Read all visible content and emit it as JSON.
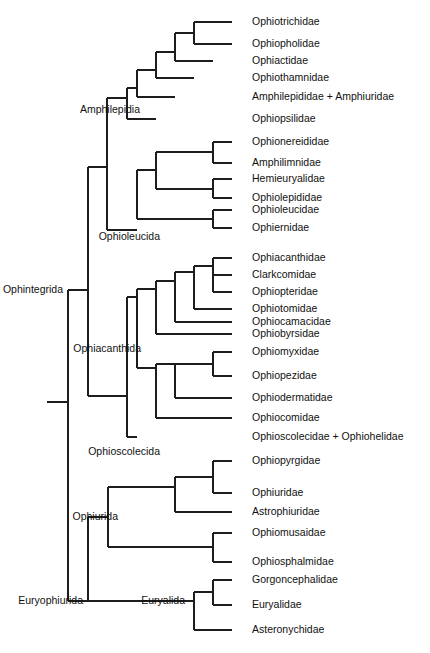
{
  "figure": {
    "name": "ophiuroidea-phylogenetic-tree",
    "type": "cladogram",
    "width": 430,
    "height": 653,
    "background_color": "#ffffff",
    "line_color": "#1d1d1d",
    "text_color": "#111111"
  },
  "tips": [
    {
      "id": "ophiotrichidae",
      "label": "Ophiotrichidae",
      "x": 232,
      "y": 22,
      "label_x": 252
    },
    {
      "id": "ophiopholidae",
      "label": "Ophiopholidae",
      "x": 232,
      "y": 44,
      "label_x": 252
    },
    {
      "id": "ophiactidae",
      "label": "Ophiactidae",
      "x": 213,
      "y": 61,
      "label_x": 252
    },
    {
      "id": "ophiothamnidae",
      "label": "Ophiothamnidae",
      "x": 194,
      "y": 78,
      "label_x": 252
    },
    {
      "id": "amphilepididae",
      "label": "Amphilepididae + Amphiuridae",
      "x": 175,
      "y": 97,
      "label_x": 252
    },
    {
      "id": "ophiopsilidae",
      "label": "Ophiopsilidae",
      "x": 156,
      "y": 119,
      "label_x": 252
    },
    {
      "id": "ophionereididae",
      "label": "Ophionereididae",
      "x": 232,
      "y": 142,
      "label_x": 252
    },
    {
      "id": "amphilimnidae",
      "label": "Amphilimnidae",
      "x": 232,
      "y": 163,
      "label_x": 252
    },
    {
      "id": "hemieuryalidae",
      "label": "Hemieuryalidae",
      "x": 232,
      "y": 179,
      "label_x": 252
    },
    {
      "id": "ophiolepididae",
      "label": "Ophiolepididae",
      "x": 232,
      "y": 198,
      "label_x": 252
    },
    {
      "id": "ophioleucidae",
      "label": "Ophioleucidae",
      "x": 232,
      "y": 210,
      "label_x": 252
    },
    {
      "id": "ophiernidae",
      "label": "Ophiernidae",
      "x": 232,
      "y": 228,
      "label_x": 252
    },
    {
      "id": "ophiacanthidae",
      "label": "Ophiacanthidae",
      "x": 232,
      "y": 258,
      "label_x": 252
    },
    {
      "id": "clarkcomidae",
      "label": "Clarkcomidae",
      "x": 232,
      "y": 275,
      "label_x": 252
    },
    {
      "id": "ophiopteridae",
      "label": "Ophiopteridae",
      "x": 213,
      "y": 292,
      "label_x": 252
    },
    {
      "id": "ophiotomidae",
      "label": "Ophiotomidae",
      "x": 194,
      "y": 309,
      "label_x": 252
    },
    {
      "id": "ophiocamacidae",
      "label": "Ophiocamacidae",
      "x": 175,
      "y": 322,
      "label_x": 252
    },
    {
      "id": "ophiobyrsidae",
      "label": "Ophiobyrsidae",
      "x": 156,
      "y": 334,
      "label_x": 252
    },
    {
      "id": "ophiomyxidae",
      "label": "Ophiomyxidae",
      "x": 232,
      "y": 352,
      "label_x": 252
    },
    {
      "id": "ophiopezidae",
      "label": "Ophiopezidae",
      "x": 232,
      "y": 376,
      "label_x": 252
    },
    {
      "id": "ophiodermatidae",
      "label": "Ophiodermatidae",
      "x": 194,
      "y": 398,
      "label_x": 252
    },
    {
      "id": "ophiocomidae",
      "label": "Ophiocomidae",
      "x": 175,
      "y": 418,
      "label_x": 252
    },
    {
      "id": "ophioscolecidae",
      "label": "Ophioscolecidae + Ophiohelidae",
      "x": 137,
      "y": 437,
      "label_x": 252
    },
    {
      "id": "ophiopyrgidae",
      "label": "Ophiopyrgidae",
      "x": 232,
      "y": 461,
      "label_x": 252
    },
    {
      "id": "ophiuridae",
      "label": "Ophiuridae",
      "x": 232,
      "y": 493,
      "label_x": 252
    },
    {
      "id": "astrophiuridae",
      "label": "Astrophiuridae",
      "x": 194,
      "y": 512,
      "label_x": 252
    },
    {
      "id": "ophiomusaidae",
      "label": "Ophiomusaidae",
      "x": 232,
      "y": 533,
      "label_x": 252
    },
    {
      "id": "ophiosphalmidae",
      "label": "Ophiosphalmidae",
      "x": 232,
      "y": 562,
      "label_x": 252
    },
    {
      "id": "gorgoncephalidae",
      "label": "Gorgoncephalidae",
      "x": 232,
      "y": 580,
      "label_x": 252
    },
    {
      "id": "euryalidae",
      "label": "Euryalidae",
      "x": 232,
      "y": 605,
      "label_x": 252
    },
    {
      "id": "asteronychidae",
      "label": "Asteronychidae",
      "x": 194,
      "y": 630,
      "label_x": 252
    }
  ],
  "clade_labels": [
    {
      "id": "ophintegrida",
      "label": "Ophintegrida",
      "x": 63,
      "y": 290,
      "anchor": "end"
    },
    {
      "id": "euryophiurida",
      "label": "Euryophiurida",
      "x": 83,
      "y": 601,
      "anchor": "end"
    },
    {
      "id": "amphilepidia",
      "label": "Amphilepidia",
      "x": 140,
      "y": 110,
      "anchor": "end"
    },
    {
      "id": "ophioleucida",
      "label": "Ophioleucida",
      "x": 160,
      "y": 237,
      "anchor": "end"
    },
    {
      "id": "ophiacanthida",
      "label": "Ophiacanthida",
      "x": 141,
      "y": 349,
      "anchor": "end"
    },
    {
      "id": "ophioscolecida",
      "label": "Ophioscolecida",
      "x": 160,
      "y": 452,
      "anchor": "end"
    },
    {
      "id": "ophiurida",
      "label": "Ophiurida",
      "x": 118,
      "y": 517,
      "anchor": "end"
    },
    {
      "id": "euryalida",
      "label": "Euryalida",
      "x": 185,
      "y": 601,
      "anchor": "end"
    }
  ],
  "segments": [
    {
      "id": "root-stub",
      "type": "h",
      "x1": 47,
      "x2": 68,
      "y": 402
    },
    {
      "id": "root-vertical",
      "type": "v",
      "x": 68,
      "y1": 290,
      "y2": 601
    },
    {
      "id": "ophintegrida-connector",
      "type": "h",
      "x1": 68,
      "x2": 88,
      "y": 290
    },
    {
      "id": "euryophiurida-connector",
      "type": "h",
      "x1": 68,
      "x2": 88,
      "y": 601
    },
    {
      "id": "ophintegrida-vertical",
      "type": "v",
      "x": 88,
      "y1": 167,
      "y2": 396
    },
    {
      "id": "amphi-ophioleuc-stem",
      "type": "h",
      "x1": 88,
      "x2": 107,
      "y": 167
    },
    {
      "id": "ophiacanthida-stem",
      "type": "h",
      "x1": 88,
      "x2": 127,
      "y": 396
    },
    {
      "id": "amphilepidia-vertical",
      "type": "v",
      "x": 107,
      "y1": 98,
      "y2": 230
    },
    {
      "id": "amphilepidia-stem",
      "type": "h",
      "x1": 107,
      "x2": 127,
      "y": 98
    },
    {
      "id": "ophioleucida-stem",
      "type": "h",
      "x1": 107,
      "x2": 137,
      "y": 230
    },
    {
      "id": "amph-inner-vertical",
      "type": "v",
      "x": 127,
      "y1": 88,
      "y2": 119
    },
    {
      "id": "amph-inner-stem",
      "type": "h",
      "x1": 127,
      "x2": 137,
      "y": 88
    },
    {
      "id": "ophiopsilidae-branch",
      "type": "h",
      "x1": 127,
      "x2": 156,
      "y": 119
    },
    {
      "id": "amph-n2-vertical",
      "type": "v",
      "x": 137,
      "y1": 70,
      "y2": 97
    },
    {
      "id": "amph-n2-stem",
      "type": "h",
      "x1": 137,
      "x2": 156,
      "y": 70
    },
    {
      "id": "amphilepididae-branch",
      "type": "h",
      "x1": 137,
      "x2": 175,
      "y": 97
    },
    {
      "id": "amph-n3-vertical",
      "type": "v",
      "x": 156,
      "y1": 52,
      "y2": 78
    },
    {
      "id": "amph-n3-stem",
      "type": "h",
      "x1": 156,
      "x2": 175,
      "y": 52
    },
    {
      "id": "ophiothamnidae-branch",
      "type": "h",
      "x1": 156,
      "x2": 194,
      "y": 78
    },
    {
      "id": "amph-n4-vertical",
      "type": "v",
      "x": 175,
      "y1": 33,
      "y2": 61
    },
    {
      "id": "amph-n4-stem",
      "type": "h",
      "x1": 175,
      "x2": 194,
      "y": 33
    },
    {
      "id": "ophiactidae-branch",
      "type": "h",
      "x1": 175,
      "x2": 213,
      "y": 61
    },
    {
      "id": "amph-n5-vertical",
      "type": "v",
      "x": 194,
      "y1": 22,
      "y2": 44
    },
    {
      "id": "ophiotrichidae-branch",
      "type": "h",
      "x1": 194,
      "x2": 232,
      "y": 22
    },
    {
      "id": "ophiopholidae-branch",
      "type": "h",
      "x1": 194,
      "x2": 232,
      "y": 44
    },
    {
      "id": "ophioleuc-vertical",
      "type": "v",
      "x": 137,
      "y1": 170,
      "y2": 219
    },
    {
      "id": "ophioleuc-upper-stem",
      "type": "h",
      "x1": 137,
      "x2": 156,
      "y": 170
    },
    {
      "id": "ophioleuc-lower-stem",
      "type": "h",
      "x1": 137,
      "x2": 213,
      "y": 219
    },
    {
      "id": "ophioleuc-n2-vertical",
      "type": "v",
      "x": 156,
      "y1": 152,
      "y2": 189
    },
    {
      "id": "ophioleuc-n2-upper",
      "type": "h",
      "x1": 156,
      "x2": 213,
      "y": 152
    },
    {
      "id": "ophioleuc-n2-lower",
      "type": "h",
      "x1": 156,
      "x2": 213,
      "y": 189
    },
    {
      "id": "ophionereid-vertical",
      "type": "v",
      "x": 213,
      "y1": 142,
      "y2": 163
    },
    {
      "id": "ophionereididae-branch",
      "type": "h",
      "x1": 213,
      "x2": 232,
      "y": 142
    },
    {
      "id": "amphilimnidae-branch",
      "type": "h",
      "x1": 213,
      "x2": 232,
      "y": 163
    },
    {
      "id": "hemieuryal-vertical",
      "type": "v",
      "x": 213,
      "y1": 179,
      "y2": 198
    },
    {
      "id": "hemieuryalidae-branch",
      "type": "h",
      "x1": 213,
      "x2": 232,
      "y": 179
    },
    {
      "id": "ophiolepididae-branch",
      "type": "h",
      "x1": 213,
      "x2": 232,
      "y": 198
    },
    {
      "id": "ophioleucidae-vertical",
      "type": "v",
      "x": 213,
      "y1": 210,
      "y2": 228
    },
    {
      "id": "ophioleucidae-branch",
      "type": "h",
      "x1": 213,
      "x2": 232,
      "y": 210
    },
    {
      "id": "ophiernidae-branch",
      "type": "h",
      "x1": 213,
      "x2": 232,
      "y": 228
    },
    {
      "id": "ophiacanthida-vertical",
      "type": "v",
      "x": 127,
      "y1": 297,
      "y2": 437
    },
    {
      "id": "ophiacanthida-upper",
      "type": "h",
      "x1": 127,
      "x2": 137,
      "y": 297
    },
    {
      "id": "ophioscolecidae-branch",
      "type": "h",
      "x1": 127,
      "x2": 137,
      "y": 437
    },
    {
      "id": "ophiac-n1-vertical",
      "type": "v",
      "x": 137,
      "y1": 289,
      "y2": 368
    },
    {
      "id": "ophiac-n1-upper",
      "type": "h",
      "x1": 137,
      "x2": 156,
      "y": 289
    },
    {
      "id": "ophiac-n1-lower",
      "type": "h",
      "x1": 137,
      "x2": 156,
      "y": 368
    },
    {
      "id": "ophiac-n2-vertical",
      "type": "v",
      "x": 156,
      "y1": 281,
      "y2": 334
    },
    {
      "id": "ophiac-n2-stem",
      "type": "h",
      "x1": 156,
      "x2": 175,
      "y": 281
    },
    {
      "id": "ophiobyrsidae-branch",
      "type": "h",
      "x1": 156,
      "x2": 232,
      "y": 334
    },
    {
      "id": "ophiac-n3-vertical",
      "type": "v",
      "x": 175,
      "y1": 272,
      "y2": 322
    },
    {
      "id": "ophiac-n3-stem",
      "type": "h",
      "x1": 175,
      "x2": 194,
      "y": 272
    },
    {
      "id": "ophiocamacidae-branch",
      "type": "h",
      "x1": 175,
      "x2": 232,
      "y": 322
    },
    {
      "id": "ophiac-n4-vertical",
      "type": "v",
      "x": 194,
      "y1": 266,
      "y2": 309
    },
    {
      "id": "ophiac-n4-stem",
      "type": "h",
      "x1": 194,
      "x2": 213,
      "y": 266
    },
    {
      "id": "ophiotomidae-branch",
      "type": "h",
      "x1": 194,
      "x2": 232,
      "y": 309
    },
    {
      "id": "ophiac-n5-vertical",
      "type": "v",
      "x": 213,
      "y1": 266,
      "y2": 292
    },
    {
      "id": "ophiopteridae-branch",
      "type": "h",
      "x1": 213,
      "x2": 232,
      "y": 292
    },
    {
      "id": "ophiac-n6-vertical",
      "type": "v",
      "x": 213,
      "y1": 258,
      "y2": 275
    },
    {
      "id": "ophiacanthidae-branch",
      "type": "h",
      "x1": 213,
      "x2": 232,
      "y": 258
    },
    {
      "id": "clarkcomidae-branch",
      "type": "h",
      "x1": 213,
      "x2": 232,
      "y": 275
    },
    {
      "id": "ophiosco-n1-vertical",
      "type": "v",
      "x": 156,
      "y1": 364,
      "y2": 418
    },
    {
      "id": "ophiosco-n1-upper",
      "type": "h",
      "x1": 156,
      "x2": 175,
      "y": 364
    },
    {
      "id": "ophiocomidae-branch",
      "type": "h",
      "x1": 156,
      "x2": 232,
      "y": 418
    },
    {
      "id": "ophiosco-n2-vertical",
      "type": "v",
      "x": 175,
      "y1": 364,
      "y2": 398
    },
    {
      "id": "ophiosco-n2-stem",
      "type": "h",
      "x1": 175,
      "x2": 194,
      "y": 364
    },
    {
      "id": "ophiodermatidae-branch",
      "type": "h",
      "x1": 175,
      "x2": 232,
      "y": 398
    },
    {
      "id": "ophiomyx-vertical",
      "type": "v",
      "x": 213,
      "y1": 352,
      "y2": 376
    },
    {
      "id": "ophiomyx-stem",
      "type": "h",
      "x1": 194,
      "x2": 213,
      "y": 364
    },
    {
      "id": "ophiomyxidae-branch",
      "type": "h",
      "x1": 213,
      "x2": 232,
      "y": 352
    },
    {
      "id": "ophiopezidae-branch",
      "type": "h",
      "x1": 213,
      "x2": 232,
      "y": 376
    },
    {
      "id": "euryophiurida-vertical",
      "type": "v",
      "x": 88,
      "y1": 517,
      "y2": 601
    },
    {
      "id": "ophiurida-stem",
      "type": "h",
      "x1": 88,
      "x2": 108,
      "y": 517
    },
    {
      "id": "euryalida-stem",
      "type": "h",
      "x1": 88,
      "x2": 194,
      "y": 601
    },
    {
      "id": "ophiurida-vertical",
      "type": "v",
      "x": 108,
      "y1": 487,
      "y2": 547
    },
    {
      "id": "ophiurida-upper-stem",
      "type": "h",
      "x1": 108,
      "x2": 175,
      "y": 487
    },
    {
      "id": "ophiurida-lower-stem",
      "type": "h",
      "x1": 108,
      "x2": 213,
      "y": 547
    },
    {
      "id": "ophiopyrg-vertical",
      "type": "v",
      "x": 175,
      "y1": 477,
      "y2": 512
    },
    {
      "id": "ophiopyrg-stem",
      "type": "h",
      "x1": 175,
      "x2": 213,
      "y": 477
    },
    {
      "id": "astrophiuridae-branch",
      "type": "h",
      "x1": 175,
      "x2": 232,
      "y": 512
    },
    {
      "id": "ophiopyrg-pair-vert",
      "type": "v",
      "x": 213,
      "y1": 461,
      "y2": 493
    },
    {
      "id": "ophiopyrgidae-branch",
      "type": "h",
      "x1": 213,
      "x2": 232,
      "y": 461
    },
    {
      "id": "ophiuridae-branch",
      "type": "h",
      "x1": 213,
      "x2": 232,
      "y": 493
    },
    {
      "id": "ophiomusa-vertical",
      "type": "v",
      "x": 213,
      "y1": 533,
      "y2": 562
    },
    {
      "id": "ophiomusaidae-branch",
      "type": "h",
      "x1": 213,
      "x2": 232,
      "y": 533
    },
    {
      "id": "ophiosphalmidae-branch",
      "type": "h",
      "x1": 213,
      "x2": 232,
      "y": 562
    },
    {
      "id": "euryalida-vertical",
      "type": "v",
      "x": 194,
      "y1": 592,
      "y2": 630
    },
    {
      "id": "euryalida-inner-stem",
      "type": "h",
      "x1": 194,
      "x2": 213,
      "y": 592
    },
    {
      "id": "asteronychidae-branch",
      "type": "h",
      "x1": 194,
      "x2": 232,
      "y": 630
    },
    {
      "id": "gorgon-vertical",
      "type": "v",
      "x": 213,
      "y1": 580,
      "y2": 605
    },
    {
      "id": "gorgoncephalidae-branch",
      "type": "h",
      "x1": 213,
      "x2": 232,
      "y": 580
    },
    {
      "id": "euryalidae-branch",
      "type": "h",
      "x1": 213,
      "x2": 232,
      "y": 605
    }
  ]
}
